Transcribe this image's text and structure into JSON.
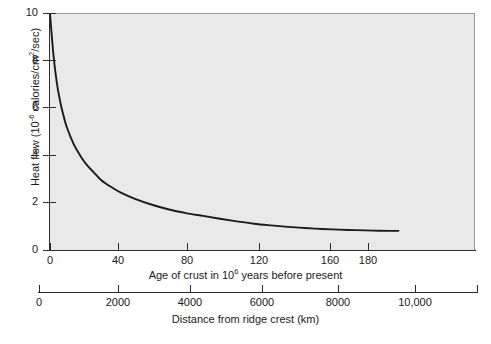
{
  "chart_data": {
    "type": "line",
    "title": "",
    "series": [
      {
        "name": "Heat flow vs age of oceanic crust",
        "points": [
          [
            0,
            10.0
          ],
          [
            2,
            8.3
          ],
          [
            4,
            7.1
          ],
          [
            6,
            6.3
          ],
          [
            8,
            5.7
          ],
          [
            10,
            5.2
          ],
          [
            14,
            4.5
          ],
          [
            18,
            4.0
          ],
          [
            22,
            3.6
          ],
          [
            26,
            3.3
          ],
          [
            30,
            3.0
          ],
          [
            36,
            2.7
          ],
          [
            42,
            2.45
          ],
          [
            50,
            2.2
          ],
          [
            60,
            1.95
          ],
          [
            70,
            1.75
          ],
          [
            80,
            1.6
          ],
          [
            90,
            1.48
          ],
          [
            100,
            1.36
          ],
          [
            110,
            1.25
          ],
          [
            120,
            1.15
          ],
          [
            130,
            1.08
          ],
          [
            140,
            1.02
          ],
          [
            150,
            0.97
          ],
          [
            160,
            0.93
          ],
          [
            170,
            0.9
          ],
          [
            180,
            0.88
          ],
          [
            190,
            0.86
          ],
          [
            200,
            0.85
          ],
          [
            205,
            0.85
          ]
        ]
      }
    ],
    "curve_color": "#1a1a1a",
    "plot_background": "#e9e9e9",
    "grid": false,
    "legend": "none",
    "y_axis": {
      "label_prefix": "Heat flow (10",
      "label_exponent": "-6",
      "label_suffix_a": " calories/cm",
      "label_exponent_b": "2",
      "label_suffix_b": "/sec)",
      "full_label": "Heat flow (10-6 calories/cm2/sec)",
      "min": 0,
      "max": 10,
      "ticks": [
        {
          "value": 10,
          "label": "10"
        },
        {
          "value": 8,
          "label": "8"
        },
        {
          "value": 6,
          "label": "6"
        },
        {
          "value": 4,
          "label": "4"
        },
        {
          "value": 2,
          "label": "2"
        },
        {
          "value": 0,
          "label": "0"
        }
      ]
    },
    "x_axis_primary": {
      "label_prefix": "Age of crust in 10",
      "label_exponent": "6",
      "label_suffix": " years before present",
      "full_label": "Age of crust in 106 years before present",
      "min": 0,
      "max": 240,
      "ticks": [
        {
          "value": 0,
          "label": "0"
        },
        {
          "value": 40,
          "label": "40"
        },
        {
          "value": 80,
          "label": "80"
        },
        {
          "value": 120,
          "label": "120"
        },
        {
          "value": 160,
          "label": "160"
        },
        {
          "value": 180,
          "label": "180"
        }
      ]
    },
    "x_axis_secondary": {
      "label": "Distance from ridge crest (km)",
      "min": 0,
      "max": 11500,
      "ticks": [
        {
          "value": 0,
          "label": "0"
        },
        {
          "value": 2000,
          "label": "2000"
        },
        {
          "value": 4000,
          "label": "4000"
        },
        {
          "value": 6000,
          "label": "6000"
        },
        {
          "value": 8000,
          "label": "8000"
        },
        {
          "value": 10000,
          "label": "10,000"
        }
      ]
    }
  },
  "geometry": {
    "y_tick_pixels": [
      13,
      60,
      107,
      155,
      202,
      250
    ],
    "x1_tick_pixels": [
      50,
      118,
      187,
      259,
      330,
      368
    ],
    "x2_tick_pixels": [
      39,
      118,
      190,
      262,
      338,
      415
    ],
    "x2_end_pixel": 477
  }
}
